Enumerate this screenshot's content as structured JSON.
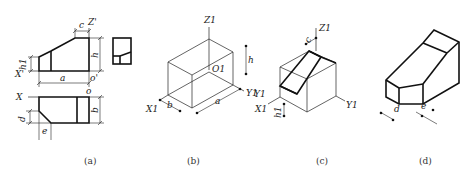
{
  "figure": {
    "panels": [
      {
        "id": "a",
        "caption": "(a)",
        "description": "Orthographic views (front, side, top) with dimensions",
        "labels": {
          "c": "c",
          "z_prime": "Z'",
          "h": "h",
          "h1": "h1",
          "x_prime": "X'",
          "a": "a",
          "o_prime": "o'",
          "x": "X",
          "o": "o",
          "b": "b",
          "d": "d",
          "e": "e"
        }
      },
      {
        "id": "b",
        "caption": "(b)",
        "description": "Bounding box in isometric with axes",
        "labels": {
          "z1": "Z1",
          "o1": "O1",
          "x1": "X1",
          "y1": "Y1",
          "a": "a",
          "b": "b",
          "h": "h"
        }
      },
      {
        "id": "c",
        "caption": "(c)",
        "description": "Cutting the bounding box",
        "labels": {
          "z1": "Z1",
          "x1": "X1",
          "y1": "Y1",
          "c": "c",
          "h1": "h1"
        }
      },
      {
        "id": "d",
        "caption": "(d)",
        "description": "Finished isometric drawing",
        "labels": {
          "d": "d",
          "e": "e"
        }
      }
    ]
  }
}
